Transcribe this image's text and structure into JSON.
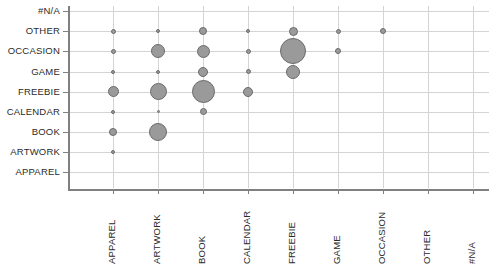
{
  "chart_data": {
    "type": "scatter",
    "subtype": "bubble-matrix",
    "title": "",
    "xlabel": "",
    "ylabel": "",
    "grid": true,
    "legend": "none",
    "bubble_fill_color": "#9a9a9a",
    "bubble_border_color": "#6b6b6b",
    "gridline_color": "#d4d4d4",
    "axis_color": "#808080",
    "x_categories": [
      "APPAREL",
      "ARTWORK",
      "BOOK",
      "CALENDAR",
      "FREEBIE",
      "GAME",
      "OCCASION",
      "OTHER",
      "#N/A"
    ],
    "y_categories": [
      "APPAREL",
      "ARTWORK",
      "BOOK",
      "CALENDAR",
      "FREEBIE",
      "GAME",
      "OCCASION",
      "OTHER",
      "#N/A"
    ],
    "points": [
      {
        "x": "APPAREL",
        "y": "ARTWORK",
        "size": 4
      },
      {
        "x": "APPAREL",
        "y": "BOOK",
        "size": 8
      },
      {
        "x": "APPAREL",
        "y": "CALENDAR",
        "size": 4
      },
      {
        "x": "APPAREL",
        "y": "FREEBIE",
        "size": 11
      },
      {
        "x": "APPAREL",
        "y": "GAME",
        "size": 4
      },
      {
        "x": "APPAREL",
        "y": "OCCASION",
        "size": 5
      },
      {
        "x": "APPAREL",
        "y": "OTHER",
        "size": 5
      },
      {
        "x": "ARTWORK",
        "y": "BOOK",
        "size": 18
      },
      {
        "x": "ARTWORK",
        "y": "CALENDAR",
        "size": 3
      },
      {
        "x": "ARTWORK",
        "y": "FREEBIE",
        "size": 17
      },
      {
        "x": "ARTWORK",
        "y": "GAME",
        "size": 4
      },
      {
        "x": "ARTWORK",
        "y": "OCCASION",
        "size": 14
      },
      {
        "x": "ARTWORK",
        "y": "OTHER",
        "size": 4
      },
      {
        "x": "BOOK",
        "y": "CALENDAR",
        "size": 7
      },
      {
        "x": "BOOK",
        "y": "FREEBIE",
        "size": 23
      },
      {
        "x": "BOOK",
        "y": "GAME",
        "size": 10
      },
      {
        "x": "BOOK",
        "y": "OCCASION",
        "size": 13
      },
      {
        "x": "BOOK",
        "y": "OTHER",
        "size": 8
      },
      {
        "x": "CALENDAR",
        "y": "FREEBIE",
        "size": 10
      },
      {
        "x": "CALENDAR",
        "y": "GAME",
        "size": 5
      },
      {
        "x": "CALENDAR",
        "y": "OCCASION",
        "size": 5
      },
      {
        "x": "CALENDAR",
        "y": "OTHER",
        "size": 4
      },
      {
        "x": "FREEBIE",
        "y": "GAME",
        "size": 14
      },
      {
        "x": "FREEBIE",
        "y": "OCCASION",
        "size": 26
      },
      {
        "x": "FREEBIE",
        "y": "OTHER",
        "size": 9
      },
      {
        "x": "GAME",
        "y": "OCCASION",
        "size": 6
      },
      {
        "x": "GAME",
        "y": "OTHER",
        "size": 5
      },
      {
        "x": "OCCASION",
        "y": "OTHER",
        "size": 6
      }
    ]
  }
}
